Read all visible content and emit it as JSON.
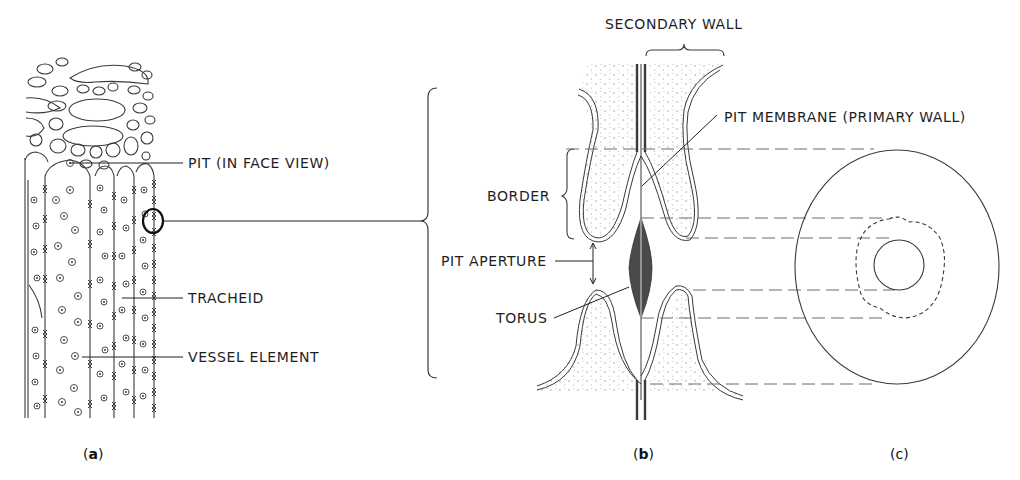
{
  "figure": {
    "panels": [
      {
        "id": "a",
        "label": "a",
        "description": "Longitudinal view of wood with tracheids and vessel elements showing pits"
      },
      {
        "id": "b",
        "label": "b",
        "description": "Section through a bordered pit with torus"
      },
      {
        "id": "c",
        "label": "c",
        "description": "Bordered pit in face view"
      }
    ],
    "labels": {
      "pit_face_view": "PIT (IN FACE VIEW)",
      "tracheid": "TRACHEID",
      "vessel_element": "VESSEL ELEMENT",
      "secondary_wall": "SECONDARY WALL",
      "pit_membrane": "PIT MEMBRANE (PRIMARY WALL)",
      "border": "BORDER",
      "pit_aperture": "PIT APERTURE",
      "torus": "TORUS"
    },
    "panel_labels": {
      "a_open": "(",
      "a": "a",
      "a_close": ")",
      "b_open": "(",
      "b": "b",
      "b_close": ")",
      "c": "(c)"
    },
    "colors": {
      "line": "#3a3a3a",
      "torus_fill": "#4a4a4a",
      "stipple": "#9a9a9a",
      "dash": "#6a6a6a"
    }
  }
}
